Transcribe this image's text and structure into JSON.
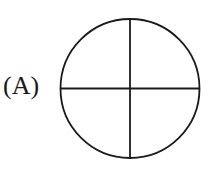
{
  "option": {
    "label": "(A)"
  },
  "figure": {
    "shape": "circle",
    "divisions": 4,
    "stroke_color": "#1a1a1a",
    "center": [
      130,
      88.5
    ],
    "radius": 69.5
  }
}
